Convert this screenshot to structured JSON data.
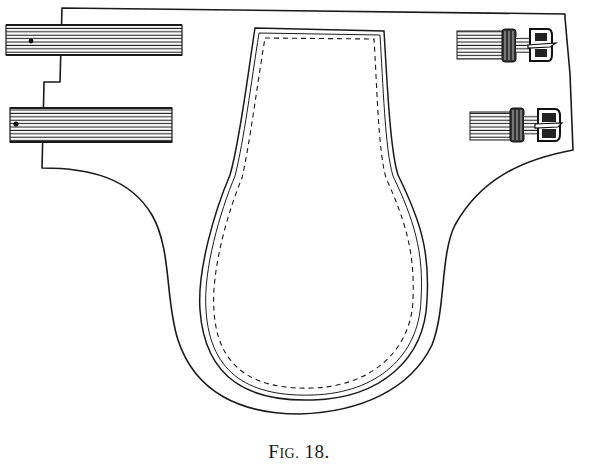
{
  "figure": {
    "caption_prefix_initial": "F",
    "caption_prefix_rest": "IG.",
    "caption_number": "18.",
    "caption_full": "Fig. 18.",
    "ink_color": "#1a1a1a",
    "paper_color": "#ffffff"
  },
  "parts": {
    "outer_outline": "outer-panel-outline",
    "inner_pad": "inner-pad-outline",
    "stitching": "dashed-stitch-line",
    "left_straps": [
      {
        "label": "upper-left-strap"
      },
      {
        "label": "lower-left-strap"
      }
    ],
    "right_buckles": [
      {
        "label": "upper-right-buckle"
      },
      {
        "label": "lower-right-buckle"
      }
    ]
  }
}
